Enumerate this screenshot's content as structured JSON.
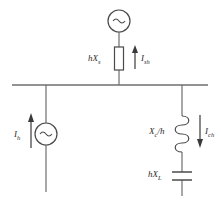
{
  "diagram": {
    "line_color": "#6e6e6e",
    "text_color": "#2b2b2b",
    "busbar": {
      "x1": 12,
      "x2": 208,
      "y": 85
    },
    "source_symbol": "~",
    "branches": {
      "center": {
        "name": "supply-source-branch",
        "x": 119,
        "source_label": "~",
        "impedance_label_main": "hX",
        "impedance_label_sub": "s",
        "current_label_main": "I",
        "current_label_sub": "sh",
        "current_direction": "up"
      },
      "left": {
        "name": "harmonic-current-source-branch",
        "x": 46,
        "source_label": "~",
        "current_label_main": "I",
        "current_label_sub": "h",
        "current_direction": "up"
      },
      "right": {
        "name": "filter-branch",
        "x": 182,
        "inductor_label_main": "X",
        "inductor_label_sub": "c",
        "inductor_label_tail": "/h",
        "capacitor_label_main": "hX",
        "capacitor_label_sub": "L",
        "current_label_main": "I",
        "current_label_sub": "ch",
        "current_direction": "down"
      }
    }
  }
}
